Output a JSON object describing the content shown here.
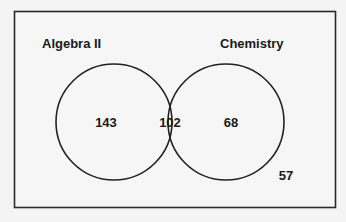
{
  "diagram": {
    "type": "venn",
    "sets": [
      {
        "name": "Algebra II",
        "only_count": "143"
      },
      {
        "name": "Chemistry",
        "only_count": "68"
      }
    ],
    "intersection_count": "102",
    "outside_count": "57"
  }
}
